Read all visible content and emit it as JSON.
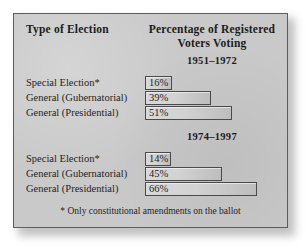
{
  "figure": {
    "header_left": "Type of Election",
    "header_right_line1": "Percentage of Registered",
    "header_right_line2": "Voters Voting",
    "footnote": "* Only constitutional amendments on the ballot",
    "panel_color": "#c9c9c9",
    "bar_fill_light": "#d9d9d9",
    "bar_fill_dark": "#bdbdbd",
    "bar_border_color": "#4a4a4a",
    "text_color": "#1f1f1f"
  },
  "groups": [
    {
      "period": "1951–1972",
      "rows": [
        {
          "label": "Special Election*",
          "value_label": "16%",
          "value": 16
        },
        {
          "label": "General (Gubernatorial)",
          "value_label": "39%",
          "value": 39
        },
        {
          "label": "General (Presidential)",
          "value_label": "51%",
          "value": 51
        }
      ]
    },
    {
      "period": "1974–1997",
      "rows": [
        {
          "label": "Special Election*",
          "value_label": "14%",
          "value": 14
        },
        {
          "label": "General (Gubernatorial)",
          "value_label": "45%",
          "value": 45
        },
        {
          "label": "General (Presidential)",
          "value_label": "66%",
          "value": 66
        }
      ]
    }
  ],
  "chart_data": {
    "type": "bar",
    "title": "Percentage of Registered Voters Voting",
    "xlabel": "Percentage of Registered Voters Voting",
    "ylabel": "Type of Election",
    "orientation": "horizontal",
    "grid": false,
    "legend": "none",
    "xlim": [
      0,
      80
    ],
    "categories": [
      "Special Election*",
      "General (Gubernatorial)",
      "General (Presidential)"
    ],
    "series": [
      {
        "name": "1951–1972",
        "values": [
          16,
          39,
          51
        ]
      },
      {
        "name": "1974–1997",
        "values": [
          14,
          45,
          66
        ]
      }
    ],
    "data_labels": [
      "16%",
      "39%",
      "51%",
      "14%",
      "45%",
      "66%"
    ],
    "annotations": [
      "* Only constitutional amendments on the ballot"
    ]
  }
}
